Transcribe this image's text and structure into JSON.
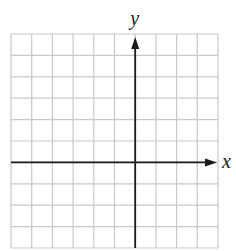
{
  "diagram": {
    "type": "coordinate-grid",
    "x_axis_label": "x",
    "y_axis_label": "y",
    "grid": {
      "columns": 10,
      "rows": 10,
      "left": 11,
      "top": 34,
      "right": 218,
      "bottom": 248,
      "y_axis_column": 6,
      "x_axis_row": 6
    },
    "colors": {
      "grid_line": "#c8c8c8",
      "axis": "#1a1a1a",
      "background": "#ffffff"
    }
  }
}
